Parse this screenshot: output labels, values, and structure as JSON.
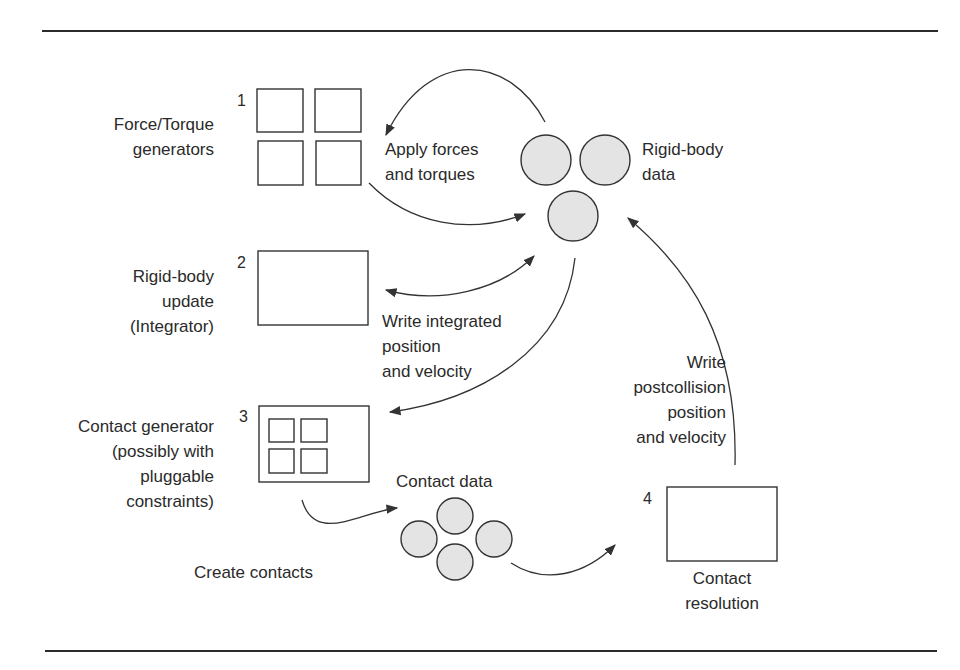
{
  "diagram": {
    "stages": [
      {
        "number": "1",
        "label": "Force/Torque\ngenerators"
      },
      {
        "number": "2",
        "label": "Rigid-body\nupdate\n(Integrator)"
      },
      {
        "number": "3",
        "label": "Contact generator\n(possibly with\npluggable\nconstraints)"
      },
      {
        "number": "4",
        "label": "Contact\nresolution"
      }
    ],
    "data_stores": [
      {
        "label": "Rigid-body\ndata"
      },
      {
        "label": "Contact data"
      }
    ],
    "edges": [
      {
        "label": "Apply forces\nand torques"
      },
      {
        "label": "Write integrated\nposition\nand velocity"
      },
      {
        "label": "Create contacts"
      },
      {
        "label": "Write\npostcollision\nposition\nand velocity"
      }
    ],
    "colors": {
      "stroke": "#333333",
      "circle_fill": "#e4e4e4",
      "text": "#2a2a2a"
    }
  }
}
